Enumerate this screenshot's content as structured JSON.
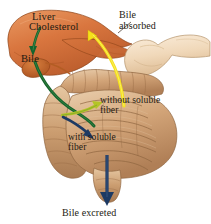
{
  "figure": {
    "background": "#ffffff",
    "palette": {
      "liver": "#d9763f",
      "liver_dark": "#b95a2a",
      "liver_light": "#e8955f",
      "gallbladder": "#c96a33",
      "stomach": "#f2dcc0",
      "stomach_shade": "#e2c19c",
      "intestine": "#cfa075",
      "intestine_light": "#e8cfae",
      "intestine_dark": "#a87a52",
      "arrow_green": "#14632e",
      "arrow_yellowgreen": "#b4c427",
      "arrow_yellow": "#f5e11a",
      "arrow_navy": "#1d3a63",
      "label_text": "#241a12",
      "leader_line": "#3a2a1c"
    }
  },
  "labels": {
    "liver": "Liver",
    "cholesterol": "Cholesterol",
    "bile": "Bile",
    "bile_absorbed": "Bile\nabsorbed",
    "without_soluble_fiber": "without soluble\nfiber",
    "with_soluble_fiber": "with soluble\nfiber",
    "bile_excreted": "Bile excreted"
  },
  "arrows": [
    {
      "name": "cholesterol-to-bile",
      "color": "#14632e",
      "from": "Cholesterol",
      "to": "Bile",
      "direction": "down"
    },
    {
      "name": "bile-to-intestine",
      "color": "#14632e",
      "from": "Bile",
      "to": "intestine",
      "direction": "down-right"
    },
    {
      "name": "without-soluble-fiber-reabsorption",
      "color": "#b4c427",
      "from": "intestine",
      "to": "without soluble fiber",
      "direction": "up-right"
    },
    {
      "name": "with-soluble-fiber-binding",
      "color": "#1d3a63",
      "from": "intestine",
      "to": "with soluble fiber",
      "direction": "down-right"
    },
    {
      "name": "bile-absorbed-return",
      "color": "#f5e11a",
      "from": "intestine",
      "to": "Liver",
      "direction": "up"
    },
    {
      "name": "bile-excreted-out",
      "color": "#1d3a63",
      "from": "colon",
      "to": "Bile excreted",
      "direction": "down"
    }
  ],
  "organs": [
    {
      "name": "liver",
      "label": "Liver"
    },
    {
      "name": "gallbladder",
      "label": "Gallbladder"
    },
    {
      "name": "stomach",
      "label": "Stomach"
    },
    {
      "name": "small-intestine",
      "label": "Small intestine"
    },
    {
      "name": "large-intestine",
      "label": "Large intestine"
    },
    {
      "name": "rectum",
      "label": "Rectum"
    }
  ]
}
